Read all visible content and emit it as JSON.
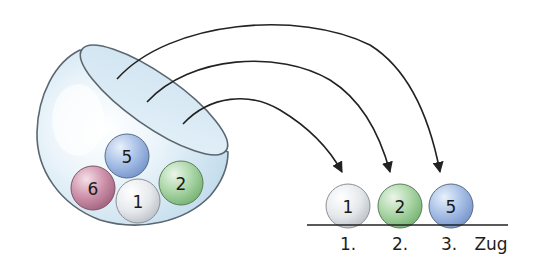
{
  "diagram": {
    "urn": {
      "balls": [
        {
          "number": "5",
          "color": "#9db6e0",
          "cx": 127,
          "cy": 156
        },
        {
          "number": "6",
          "color": "#c98ea6",
          "cx": 93,
          "cy": 188
        },
        {
          "number": "1",
          "color": "#e3e6ea",
          "cx": 138,
          "cy": 201
        },
        {
          "number": "2",
          "color": "#a9d3a6",
          "cx": 181,
          "cy": 183
        }
      ]
    },
    "drawn": {
      "balls": [
        {
          "number": "1",
          "color": "#e3e6ea",
          "cx": 348,
          "cy": 206
        },
        {
          "number": "2",
          "color": "#a9d3a6",
          "cx": 400,
          "cy": 206
        },
        {
          "number": "5",
          "color": "#9db6e0",
          "cx": 451,
          "cy": 206
        }
      ],
      "labels": [
        "1.",
        "2.",
        "3."
      ],
      "axis_label": "Zug"
    },
    "colors": {
      "bowl_fill": "#dcebf5",
      "bowl_stroke": "#5a6670",
      "arrow": "#222222",
      "baseline": "#222222"
    }
  }
}
